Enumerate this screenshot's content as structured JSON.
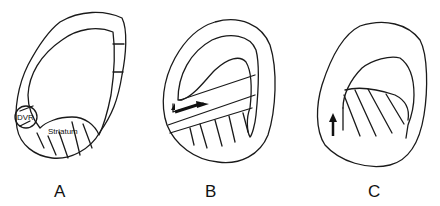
{
  "panels": [
    {
      "id": "A",
      "label": "A",
      "annotations": {
        "dvr": "DVR",
        "striatum": "Striatum"
      }
    },
    {
      "id": "B",
      "label": "B"
    },
    {
      "id": "C",
      "label": "C"
    }
  ],
  "colors": {
    "stroke": "#1a1a1a",
    "background": "#ffffff"
  }
}
